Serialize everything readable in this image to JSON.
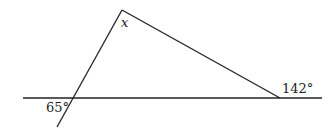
{
  "diagram": {
    "type": "geometry-triangle-angles",
    "labels": {
      "apex_angle": "x",
      "left_angle": "65°",
      "right_angle": "142°"
    },
    "points": {
      "apex": [
        122,
        10
      ],
      "left_intersection": [
        73,
        98
      ],
      "right_vertex": [
        280,
        98
      ],
      "line_start": [
        23,
        98
      ],
      "line_end": [
        322,
        98
      ],
      "transversal_end": [
        57,
        127
      ]
    },
    "colors": {
      "stroke": "#222222",
      "background": "#ffffff"
    }
  }
}
